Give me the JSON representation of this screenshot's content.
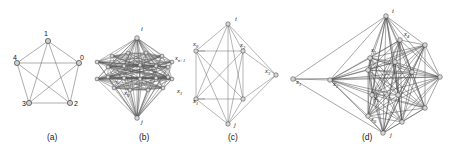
{
  "figure": {
    "background": "#ffffff",
    "edge_color": "#5a5a5a",
    "node_fill": "#d8d8d8",
    "node_stroke": "#444444",
    "captions": [
      {
        "key": "a",
        "text": "(a)",
        "x": 47,
        "y": 140
      },
      {
        "key": "b",
        "text": "(b)",
        "x": 139,
        "y": 140
      },
      {
        "key": "c",
        "text": "(c)",
        "x": 228,
        "y": 140
      },
      {
        "key": "d",
        "text": "(d)",
        "x": 362,
        "y": 140
      }
    ]
  },
  "panels": {
    "a": {
      "caption": "(a)",
      "type": "complete-graph-K5",
      "nodes": [
        {
          "id": "1",
          "label": "1",
          "x": 48,
          "y": 41,
          "lx": 44,
          "ly": 36
        },
        {
          "id": "0",
          "label": "0",
          "x": 79,
          "y": 63,
          "lx": 80,
          "ly": 60
        },
        {
          "id": "2",
          "label": "2",
          "x": 70,
          "y": 103,
          "lx": 74,
          "ly": 106
        },
        {
          "id": "3",
          "label": "3",
          "x": 29,
          "y": 103,
          "lx": 22,
          "ly": 106
        },
        {
          "id": "4",
          "label": "4",
          "x": 17,
          "y": 63,
          "lx": 13,
          "ly": 60
        }
      ],
      "edges": [
        [
          "1",
          "0"
        ],
        [
          "1",
          "2"
        ],
        [
          "1",
          "3"
        ],
        [
          "1",
          "4"
        ],
        [
          "0",
          "2"
        ],
        [
          "0",
          "3"
        ],
        [
          "0",
          "4"
        ],
        [
          "2",
          "3"
        ],
        [
          "2",
          "4"
        ],
        [
          "3",
          "4"
        ]
      ]
    },
    "b": {
      "caption": "(b)",
      "type": "dense-layered-graph",
      "labels": [
        {
          "text": "i",
          "x": 141,
          "y": 31
        },
        {
          "text": "j",
          "x": 141,
          "y": 124
        },
        {
          "text": "x",
          "sub": "0",
          "x": 124,
          "y": 95
        },
        {
          "text": "x",
          "sub": "1",
          "x": 177,
          "y": 93
        },
        {
          "text": "x",
          "sub": "n+1",
          "x": 175,
          "y": 60
        }
      ],
      "apex_top": {
        "x": 137,
        "y": 38
      },
      "apex_bottom": {
        "x": 137,
        "y": 118
      },
      "left_col": [
        {
          "x": 97,
          "y": 62
        },
        {
          "x": 97,
          "y": 79
        }
      ],
      "right_col": [
        {
          "x": 172,
          "y": 62
        },
        {
          "x": 172,
          "y": 79
        }
      ],
      "mid_nodes": [
        {
          "x": 112,
          "y": 56
        },
        {
          "x": 128,
          "y": 53
        },
        {
          "x": 146,
          "y": 53
        },
        {
          "x": 162,
          "y": 56
        },
        {
          "x": 108,
          "y": 67
        },
        {
          "x": 124,
          "y": 66
        },
        {
          "x": 140,
          "y": 65
        },
        {
          "x": 156,
          "y": 66
        },
        {
          "x": 168,
          "y": 67
        },
        {
          "x": 108,
          "y": 77
        },
        {
          "x": 124,
          "y": 78
        },
        {
          "x": 140,
          "y": 79
        },
        {
          "x": 156,
          "y": 78
        },
        {
          "x": 168,
          "y": 77
        },
        {
          "x": 114,
          "y": 88
        },
        {
          "x": 130,
          "y": 90
        },
        {
          "x": 148,
          "y": 90
        },
        {
          "x": 163,
          "y": 88
        }
      ]
    },
    "c": {
      "caption": "(c)",
      "type": "bipyramid-graph",
      "labels": [
        {
          "text": "i",
          "x": 235,
          "y": 21
        },
        {
          "text": "j",
          "x": 234,
          "y": 127
        },
        {
          "text": "x",
          "sub": "0",
          "x": 193,
          "y": 46
        },
        {
          "text": "x",
          "sub": "1",
          "x": 193,
          "y": 103
        },
        {
          "text": "x",
          "sub": "2",
          "x": 240,
          "y": 47
        },
        {
          "text": "x",
          "sub": "3",
          "x": 265,
          "y": 73
        }
      ],
      "nodes": [
        {
          "id": "i",
          "x": 228,
          "y": 24
        },
        {
          "id": "j",
          "x": 228,
          "y": 124
        },
        {
          "id": "x0",
          "x": 196,
          "y": 51
        },
        {
          "id": "x1",
          "x": 196,
          "y": 99
        },
        {
          "id": "x2",
          "x": 243,
          "y": 51
        },
        {
          "id": "x3",
          "x": 243,
          "y": 99
        },
        {
          "id": "r",
          "x": 276,
          "y": 75
        }
      ],
      "edges": [
        [
          "i",
          "x0"
        ],
        [
          "i",
          "x1"
        ],
        [
          "i",
          "x2"
        ],
        [
          "i",
          "x3"
        ],
        [
          "i",
          "r"
        ],
        [
          "j",
          "x0"
        ],
        [
          "j",
          "x1"
        ],
        [
          "j",
          "x2"
        ],
        [
          "j",
          "x3"
        ],
        [
          "j",
          "r"
        ],
        [
          "x0",
          "x1"
        ],
        [
          "x0",
          "x2"
        ],
        [
          "x0",
          "x3"
        ],
        [
          "x1",
          "x2"
        ],
        [
          "x1",
          "x3"
        ],
        [
          "x2",
          "x3"
        ],
        [
          "x2",
          "r"
        ],
        [
          "x3",
          "r"
        ],
        [
          "i",
          "j"
        ]
      ]
    },
    "d": {
      "caption": "(d)",
      "type": "large-dense-graph",
      "labels": [
        {
          "text": "i",
          "x": 392,
          "y": 13
        },
        {
          "text": "j",
          "x": 390,
          "y": 137
        },
        {
          "text": "x",
          "sub": "1",
          "x": 296,
          "y": 84
        },
        {
          "text": "x",
          "sub": "2",
          "x": 333,
          "y": 86
        },
        {
          "text": "x",
          "sub": "3",
          "x": 371,
          "y": 52
        },
        {
          "text": "x",
          "sub": "4",
          "x": 404,
          "y": 36
        },
        {
          "text": "x",
          "sub": "5",
          "x": 374,
          "y": 100
        },
        {
          "text": "x",
          "sub": "6",
          "x": 371,
          "y": 121
        }
      ],
      "nodes": [
        {
          "id": "i",
          "x": 386,
          "y": 16
        },
        {
          "id": "j",
          "x": 383,
          "y": 133
        },
        {
          "id": "x1",
          "x": 293,
          "y": 79
        },
        {
          "id": "x2",
          "x": 330,
          "y": 80
        },
        {
          "id": "x3",
          "x": 370,
          "y": 58
        },
        {
          "id": "x4",
          "x": 400,
          "y": 40
        },
        {
          "id": "x5",
          "x": 372,
          "y": 95
        },
        {
          "id": "x6",
          "x": 368,
          "y": 116
        },
        {
          "id": "n1",
          "x": 425,
          "y": 45
        },
        {
          "id": "n2",
          "x": 440,
          "y": 77
        },
        {
          "id": "n3",
          "x": 425,
          "y": 108
        },
        {
          "id": "n4",
          "x": 402,
          "y": 122
        },
        {
          "id": "n5",
          "x": 368,
          "y": 70
        },
        {
          "id": "n6",
          "x": 395,
          "y": 62
        },
        {
          "id": "n7",
          "x": 398,
          "y": 95
        },
        {
          "id": "n8",
          "x": 412,
          "y": 72
        }
      ]
    }
  }
}
